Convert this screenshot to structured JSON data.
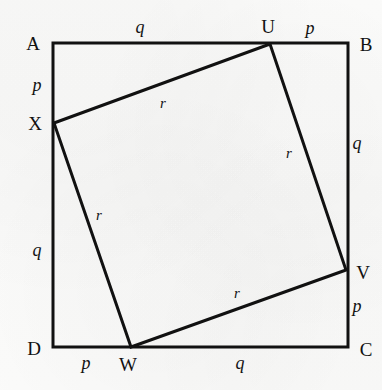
{
  "figure": {
    "width": 382,
    "height": 390,
    "background_color": "#fdfdfd",
    "line_color": "#111111",
    "outer_square": {
      "name": "ABCD",
      "stroke_width": 3,
      "vertices": [
        {
          "id": "A",
          "label": "A",
          "x": 53,
          "y": 43,
          "label_x": 33,
          "label_y": 43
        },
        {
          "id": "B",
          "label": "B",
          "x": 348,
          "y": 43,
          "label_x": 366,
          "label_y": 44
        },
        {
          "id": "C",
          "label": "C",
          "x": 348,
          "y": 347,
          "label_x": 366,
          "label_y": 349
        },
        {
          "id": "D",
          "label": "D",
          "x": 53,
          "y": 347,
          "label_x": 34,
          "label_y": 348
        }
      ]
    },
    "inner_square": {
      "name": "UVWX",
      "stroke_width": 3,
      "vertices": [
        {
          "id": "U",
          "label": "U",
          "x": 270,
          "y": 44,
          "label_x": 268,
          "label_y": 26
        },
        {
          "id": "V",
          "label": "V",
          "x": 346,
          "y": 270,
          "label_x": 363,
          "label_y": 272
        },
        {
          "id": "W",
          "label": "W",
          "x": 131,
          "y": 347,
          "label_x": 128,
          "label_y": 364
        },
        {
          "id": "X",
          "label": "X",
          "x": 54,
          "y": 123,
          "label_x": 35,
          "label_y": 123
        }
      ]
    },
    "segment_labels": [
      {
        "id": "top-q",
        "text": "q",
        "edge": "A-U",
        "x": 140,
        "y": 27
      },
      {
        "id": "top-p",
        "text": "p",
        "edge": "U-B",
        "x": 310,
        "y": 28
      },
      {
        "id": "right-q",
        "text": "q",
        "edge": "B-V",
        "x": 357,
        "y": 143
      },
      {
        "id": "right-p",
        "text": "p",
        "edge": "V-C",
        "x": 357,
        "y": 306
      },
      {
        "id": "bottom-q",
        "text": "q",
        "edge": "C-W",
        "x": 240,
        "y": 363
      },
      {
        "id": "bottom-p",
        "text": "p",
        "edge": "W-D",
        "x": 86,
        "y": 363
      },
      {
        "id": "left-q",
        "text": "q",
        "edge": "D-X",
        "x": 37,
        "y": 250
      },
      {
        "id": "left-p",
        "text": "p",
        "edge": "X-A",
        "x": 37,
        "y": 85
      }
    ],
    "inner_side_labels": [
      {
        "id": "r-xu",
        "text": "r",
        "edge": "X-U",
        "x": 163,
        "y": 103
      },
      {
        "id": "r-uv",
        "text": "r",
        "edge": "U-V",
        "x": 289,
        "y": 153
      },
      {
        "id": "r-wv",
        "text": "r",
        "edge": "W-V",
        "x": 237,
        "y": 293
      },
      {
        "id": "r-xw",
        "text": "r",
        "edge": "X-W",
        "x": 99,
        "y": 215
      }
    ]
  }
}
